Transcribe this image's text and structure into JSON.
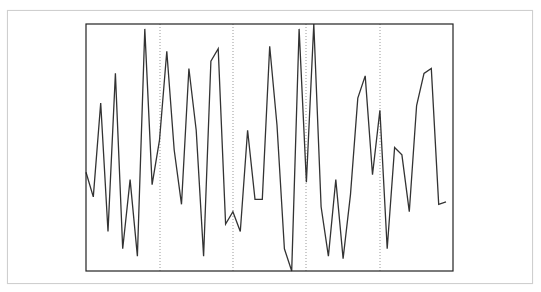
{
  "chart_data": {
    "type": "line",
    "title": "",
    "xlabel": "",
    "ylabel": "",
    "grid": {
      "x": "dotted vertical",
      "y": false
    },
    "legend": null,
    "xlim": [
      0,
      49
    ],
    "ylim": [
      0,
      1
    ],
    "vertical_gridlines_at_index": [
      10,
      20,
      30,
      40
    ],
    "x": [
      0,
      1,
      2,
      3,
      4,
      5,
      6,
      7,
      8,
      9,
      10,
      11,
      12,
      13,
      14,
      15,
      16,
      17,
      18,
      19,
      20,
      21,
      22,
      23,
      24,
      25,
      26,
      27,
      28,
      29,
      30,
      31,
      32,
      33,
      34,
      35,
      36,
      37,
      38,
      39,
      40,
      41,
      42,
      43,
      44,
      45,
      46,
      47,
      48,
      49
    ],
    "series": [
      {
        "name": "series-1",
        "color": "#333333",
        "values": [
          0.4,
          0.3,
          0.68,
          0.16,
          0.8,
          0.09,
          0.37,
          0.06,
          0.98,
          0.35,
          0.53,
          0.89,
          0.49,
          0.27,
          0.82,
          0.57,
          0.06,
          0.85,
          0.9,
          0.19,
          0.24,
          0.16,
          0.57,
          0.29,
          0.29,
          0.91,
          0.59,
          0.09,
          0.0,
          0.98,
          0.36,
          1.0,
          0.26,
          0.06,
          0.37,
          0.05,
          0.31,
          0.7,
          0.79,
          0.39,
          0.65,
          0.09,
          0.5,
          0.47,
          0.24,
          0.67,
          0.8,
          0.82,
          0.27,
          0.28
        ]
      }
    ]
  },
  "layout": {
    "card": {
      "left": 7,
      "top": 10,
      "right": 533,
      "bottom": 284,
      "border_color": "#cfcfcf"
    },
    "plot": {
      "left": 86,
      "top": 24,
      "right": 453,
      "bottom": 271,
      "frame_color": "#222222"
    },
    "line_color": "#333333",
    "gridline_color": "#999999"
  }
}
